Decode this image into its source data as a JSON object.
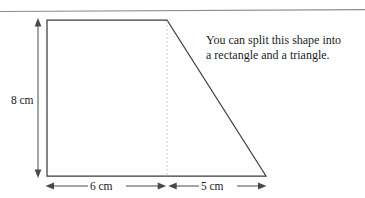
{
  "figure": {
    "kind": "geometry-diagram",
    "shape_name": "trapezium",
    "annotation": {
      "line1": "You can split this shape into",
      "line2": "a rectangle and a triangle."
    },
    "dimensions": {
      "height": "8 cm",
      "base_left": "6 cm",
      "base_right": "5 cm"
    },
    "colors": {
      "outline": "#3b3b3b",
      "dashed_split": "#b9b9b9",
      "dimension": "#4a4a4a",
      "rule": "#8d8d8d",
      "text": "#201d1c",
      "background": "#ffffff"
    },
    "geometry": {
      "rect_left_x": 47,
      "rect_right_x": 167,
      "top_y": 20,
      "bottom_y": 176,
      "apex_x": 167,
      "apex_y": 20,
      "slope_end_x": 266,
      "slope_end_y": 176,
      "dimension_line_y": 186,
      "vertical_dimension_x": 38
    },
    "parts": {
      "rectangle_label": "rectangle",
      "triangle_label": "triangle"
    },
    "icons": {
      "arrow_up": "arrow-up-icon",
      "arrow_down": "arrow-down-icon",
      "arrow_left": "arrow-left-icon",
      "arrow_right": "arrow-right-icon"
    }
  }
}
